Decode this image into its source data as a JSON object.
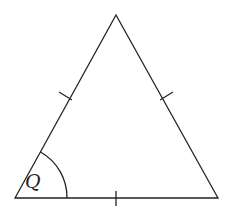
{
  "diagram": {
    "type": "equilateral-triangle",
    "angle_label": "Q",
    "vertices": {
      "apex": [
        116,
        15
      ],
      "bottom_left": [
        15,
        198
      ],
      "bottom_right": [
        218,
        198
      ]
    },
    "tick_marks": 3,
    "colors": {
      "stroke": "#222222",
      "background": "#ffffff"
    }
  }
}
